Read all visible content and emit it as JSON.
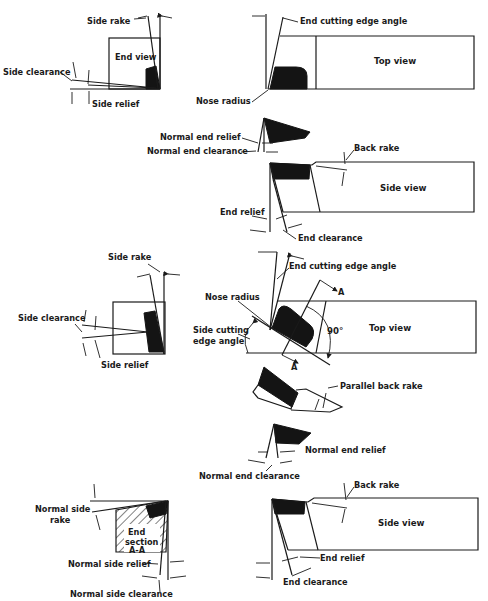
{
  "figure": {
    "ink_color": "#1a1a1a",
    "background_color": "#ffffff"
  },
  "upper_tool": {
    "end_view": {
      "title": "End view",
      "labels": {
        "side_rake": "Side rake",
        "side_clearance": "Side clearance",
        "side_relief": "Side relief"
      }
    },
    "top_view": {
      "title": "Top view",
      "labels": {
        "end_cutting_edge_angle": "End cutting edge angle",
        "nose_radius": "Nose radius"
      }
    },
    "normal_section": {
      "labels": {
        "normal_end_relief": "Normal end relief",
        "normal_end_clearance": "Normal end clearance"
      }
    },
    "side_view": {
      "title": "Side view",
      "labels": {
        "back_rake": "Back rake",
        "end_relief": "End relief",
        "end_clearance": "End clearance"
      }
    }
  },
  "lower_tool": {
    "end_view": {
      "labels": {
        "side_rake": "Side rake",
        "side_clearance": "Side clearance",
        "side_relief": "Side relief"
      }
    },
    "top_view": {
      "title": "Top view",
      "angle_90": "90°",
      "section_marker": "A",
      "labels": {
        "end_cutting_edge_angle": "End cutting edge angle",
        "nose_radius": "Nose radius",
        "side_cutting_edge_angle_line1": "Side cutting",
        "side_cutting_edge_angle_line2": "edge angle"
      }
    },
    "parallel_section": {
      "labels": {
        "parallel_back_rake": "Parallel back rake"
      }
    },
    "normal_section": {
      "labels": {
        "normal_end_relief": "Normal end relief",
        "normal_end_clearance": "Normal end clearance"
      }
    },
    "end_section": {
      "title_line1": "End",
      "title_line2": "section",
      "title_line3": "A-A",
      "labels": {
        "normal_side_rake_line1": "Normal side",
        "normal_side_rake_line2": "rake",
        "normal_side_relief": "Normal side relief",
        "normal_side_clearance": "Normal side clearance"
      }
    },
    "side_view": {
      "title": "Side view",
      "labels": {
        "back_rake": "Back rake",
        "end_relief": "End relief",
        "end_clearance": "End clearance"
      }
    }
  }
}
